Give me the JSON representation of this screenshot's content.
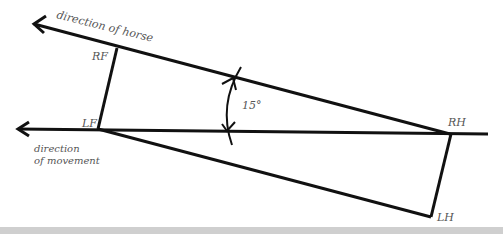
{
  "diagram": {
    "labels": {
      "direction_of_horse": "direction of horse",
      "direction_of_movement_line1": "direction",
      "direction_of_movement_line2": "of movement",
      "rf": "RF",
      "lf": "LF",
      "rh": "RH",
      "lh": "LH",
      "angle": "15°"
    },
    "colors": {
      "line": "#111111",
      "label": "#555555",
      "band": "#cfcfcf"
    }
  }
}
